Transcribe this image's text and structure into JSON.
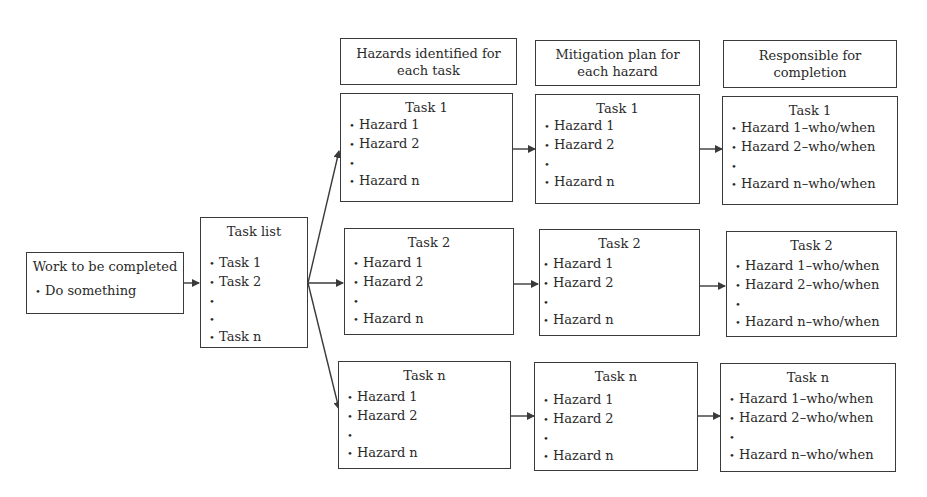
{
  "work": {
    "title": "Work to be completed",
    "items": [
      "Do something"
    ]
  },
  "task_list": {
    "title": "Task list",
    "items": [
      "Task 1",
      "Task 2",
      "",
      "",
      "Task n"
    ]
  },
  "headers": {
    "hazards": "Hazards identified for each task",
    "mitigation": "Mitigation plan for each hazard",
    "responsible": "Responsible for completion"
  },
  "rows": [
    {
      "task": "Task 1",
      "hazards": [
        "Hazard 1",
        "Hazard 2",
        "",
        "Hazard n"
      ],
      "mitigation": [
        "Hazard 1",
        "Hazard 2",
        "",
        "Hazard n"
      ],
      "responsible": [
        "Hazard 1–who/when",
        "Hazard 2–who/when",
        "",
        "Hazard n–who/when"
      ]
    },
    {
      "task": "Task 2",
      "hazards": [
        "Hazard 1",
        "Hazard 2",
        "",
        "Hazard n"
      ],
      "mitigation": [
        "Hazard 1",
        "Hazard 2",
        "",
        "Hazard n"
      ],
      "responsible": [
        "Hazard 1–who/when",
        "Hazard 2–who/when",
        "",
        "Hazard n–who/when"
      ]
    },
    {
      "task": "Task n",
      "hazards": [
        "Hazard 1",
        "Hazard 2",
        "",
        "Hazard n"
      ],
      "mitigation": [
        "Hazard 1",
        "Hazard 2",
        "",
        "Hazard n"
      ],
      "responsible": [
        "Hazard 1–who/when",
        "Hazard 2–who/when",
        "",
        "Hazard n–who/when"
      ]
    }
  ],
  "bullet": "•",
  "colors": {
    "line": "#3a3a3a",
    "text": "#2a2a2a",
    "background": "#ffffff"
  }
}
